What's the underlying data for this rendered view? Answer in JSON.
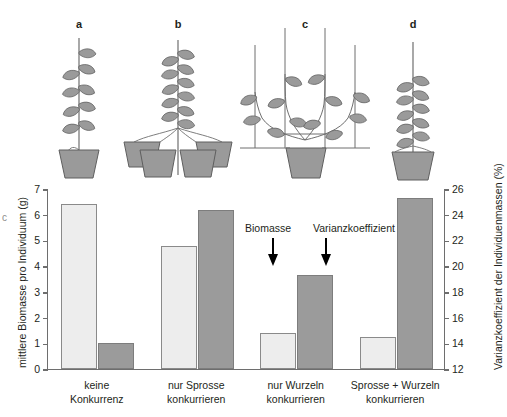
{
  "figure": {
    "panels": [
      {
        "letter": "a",
        "name": "single-plant-single-pot"
      },
      {
        "letter": "b",
        "name": "shoots-together-roots-separate-pots"
      },
      {
        "letter": "c",
        "name": "shoots-separated-roots-shared-pot"
      },
      {
        "letter": "d",
        "name": "shoots-and-roots-together-one-pot"
      }
    ],
    "edge_mark": "c"
  },
  "annotations": {
    "biomass_label": "Biomasse",
    "variance_label": "Varianzkoeffizient"
  },
  "chart_data": {
    "type": "bar",
    "title": "",
    "categories": [
      "keine\nKonkurrenz",
      "nur Sprosse\nkonkurrieren",
      "nur Wurzeln\nkonkurrieren",
      "Sprosse + Wurzeln\nkonkurrieren"
    ],
    "category_lines": [
      [
        "keine",
        "Konkurrenz"
      ],
      [
        "nur Sprosse",
        "konkurrieren"
      ],
      [
        "nur Wurzeln",
        "konkurrieren"
      ],
      [
        "Sprosse + Wurzeln",
        "konkurrieren"
      ]
    ],
    "series": [
      {
        "name": "Biomasse",
        "axis": "left",
        "color": "#ededed",
        "values": [
          6.4,
          4.8,
          1.4,
          1.25
        ]
      },
      {
        "name": "Varianzkoeffizient",
        "axis": "right",
        "color": "#9b9b9b",
        "values": [
          14.0,
          24.4,
          19.3,
          25.3
        ]
      }
    ],
    "xlabel": "",
    "ylabel": "mittlere Biomasse pro Individuum (g)",
    "y2label": "Varianzkoeffizient der Individuenmassen (%)",
    "ylim": [
      0,
      7
    ],
    "y2lim": [
      12,
      26
    ],
    "yticks": [
      0,
      1,
      2,
      3,
      4,
      5,
      6,
      7
    ],
    "y2ticks": [
      12,
      14,
      16,
      18,
      20,
      22,
      24,
      26
    ],
    "grid": false,
    "legend": "none"
  }
}
